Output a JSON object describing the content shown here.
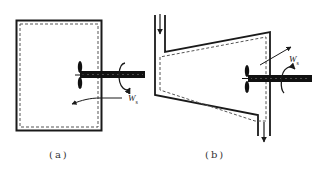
{
  "figure": {
    "panels": [
      {
        "id": "a",
        "caption": "(a)",
        "description": "closed rigid tank with stirring paddle (shaft work input)",
        "work_label": "W",
        "work_subscript": "s",
        "work_direction": "into system"
      },
      {
        "id": "b",
        "caption": "(b)",
        "description": "open flow system (duct with inlet and outlet) with paddle wheel (shaft work output)",
        "work_label": "W",
        "work_subscript": "s",
        "work_direction": "out of system"
      }
    ],
    "colors": {
      "line": "#1a1a1a",
      "boundary_dashed": "#555555",
      "background": "#ffffff"
    }
  }
}
